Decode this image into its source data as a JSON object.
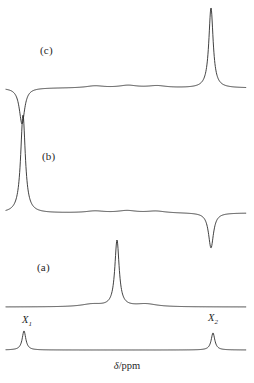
{
  "figure": {
    "axis_label_symbol": "δ",
    "axis_label_rest": "/ppm",
    "axis_label_full": "δ/ppm",
    "stroke_color": "#2b2b2b",
    "background_color": "#ffffff"
  },
  "traces": [
    {
      "id": "trace-c",
      "label": "(c)",
      "label_x": 40,
      "label_y": 44,
      "baseline_y": 88,
      "peaks": [
        {
          "name": "X1",
          "x": 22,
          "height": -36,
          "polarity": "negative",
          "width": 3.2
        },
        {
          "name": "X2",
          "x": 211,
          "height": 80,
          "polarity": "positive",
          "width": 2.6
        }
      ],
      "bumps": [
        {
          "x": 95,
          "height": 2.0,
          "width": 11
        },
        {
          "x": 128,
          "height": 2.4,
          "width": 11
        },
        {
          "x": 157,
          "height": 2.0,
          "width": 11
        }
      ],
      "x_start": 6,
      "x_end": 246
    },
    {
      "id": "trace-b",
      "label": "(b)",
      "label_x": 42,
      "label_y": 150,
      "baseline_y": 213,
      "peaks": [
        {
          "name": "X1",
          "x": 23,
          "height": 98,
          "polarity": "positive",
          "width": 2.8
        },
        {
          "name": "X2",
          "x": 211,
          "height": -35,
          "polarity": "negative",
          "width": 3.0
        }
      ],
      "bumps": [
        {
          "x": 95,
          "height": 1.8,
          "width": 11
        },
        {
          "x": 127,
          "height": 2.2,
          "width": 11
        },
        {
          "x": 156,
          "height": 1.8,
          "width": 11
        }
      ],
      "x_start": 6,
      "x_end": 246
    },
    {
      "id": "trace-a",
      "label": "(a)",
      "label_x": 37,
      "label_y": 261,
      "baseline_y": 307,
      "peaks": [
        {
          "name": "main",
          "x": 117,
          "height": 66,
          "polarity": "positive",
          "width": 2.6
        }
      ],
      "bumps": [
        {
          "x": 92,
          "height": 2.6,
          "width": 13
        },
        {
          "x": 146,
          "height": 2.8,
          "width": 13
        }
      ],
      "x_start": 6,
      "x_end": 246
    },
    {
      "id": "trace-reference",
      "label": "",
      "label_x": 0,
      "label_y": 0,
      "baseline_y": 350,
      "peaks": [
        {
          "name": "X1",
          "x": 24,
          "height": 19,
          "polarity": "positive",
          "width": 2.2
        },
        {
          "name": "X2",
          "x": 213,
          "height": 17,
          "polarity": "positive",
          "width": 2.2
        }
      ],
      "bumps": [],
      "x_start": 6,
      "x_end": 246
    }
  ],
  "peak_labels": [
    {
      "id": "label-x1",
      "base": "X",
      "sub": "1",
      "x": 22,
      "y": 314
    },
    {
      "id": "label-x2",
      "base": "X",
      "sub": "2",
      "x": 208,
      "y": 312
    }
  ],
  "axis": {
    "label_x": 92,
    "label_y": 360,
    "label_width": 70
  },
  "chart_data": {
    "type": "line",
    "title": "",
    "subtitle": "",
    "xlabel": "δ/ppm",
    "ylabel": "",
    "grid": false,
    "legend": "none",
    "x": [
      "X1",
      "X2"
    ],
    "series": [
      {
        "name": "(c)",
        "values": [
          -36,
          80
        ],
        "note": "Negative (inverted) line at X1; large positive line at X2."
      },
      {
        "name": "(b)",
        "values": [
          98,
          -35
        ],
        "note": "Large positive line at X1; negative (inverted) line at X2."
      },
      {
        "name": "(a)",
        "values": [
          0,
          0
        ],
        "note": "Single large positive line at the centre of the range, between X1 and X2; no intensity at X1 or X2."
      },
      {
        "name": "reference",
        "values": [
          19,
          17
        ],
        "note": "Normal spectrum showing both X1 and X2 as positive lines of similar intensity."
      }
    ],
    "annotations": [
      "(a)",
      "(b)",
      "(c)",
      "X1",
      "X2"
    ]
  }
}
